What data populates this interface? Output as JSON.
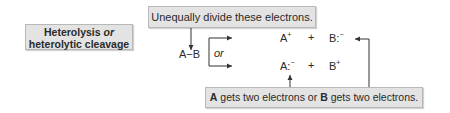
{
  "title_box": {
    "line1_main": "Heterolysis",
    "line1_italic": "or",
    "line2": "heterolytic cleavage"
  },
  "top_note": "Unequally divide these electrons.",
  "reactant": "A−B",
  "branch_label": "or",
  "products_top": {
    "a": "A",
    "a_charge": "+",
    "plus": "+",
    "b": "B:",
    "b_charge": "−"
  },
  "products_bottom": {
    "a": "A:",
    "a_charge": "−",
    "plus": "+",
    "b": "B",
    "b_charge": "+"
  },
  "bottom_note": {
    "part1_bold": "A",
    "part2": " gets two electrons or ",
    "part3_bold": "B",
    "part4": " gets two electrons."
  },
  "colors": {
    "box_fill": "#e3e3e3",
    "box_border": "#b8b8b8",
    "line": "#333333"
  }
}
